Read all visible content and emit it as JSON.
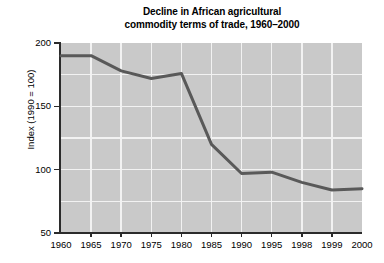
{
  "chart_data": {
    "type": "line",
    "title": "Decline in African agricultural commodity terms of trade, 1960–2000",
    "title_lines": [
      "Decline in African agricultural",
      "commodity terms of trade, 1960–2000"
    ],
    "xlabel": "",
    "ylabel": "Index (1990 = 100)",
    "categories": [
      "1960",
      "1965",
      "1970",
      "1975",
      "1980",
      "1985",
      "1990",
      "1995",
      "1998",
      "1999",
      "2000"
    ],
    "series": [
      {
        "name": "African agricultural commodity terms of trade",
        "values": [
          190,
          190,
          178,
          172,
          176,
          120,
          97,
          98,
          90,
          84,
          85
        ]
      }
    ],
    "ylim": [
      50,
      200
    ],
    "y_ticks": [
      50,
      100,
      150,
      200
    ],
    "y_tick_labels": [
      "50",
      "100",
      "150",
      "200"
    ],
    "y_gridlines": [
      50,
      75,
      100,
      125,
      150,
      175,
      200
    ],
    "grid": true,
    "legend": "none",
    "colors": {
      "plot_background": "#c9c9c9",
      "gridline": "#f2f2f2",
      "line": "#595959",
      "axis": "#2b2b2b",
      "text": "#000000",
      "figure_background": "#ffffff"
    },
    "line_width_px": 3
  }
}
